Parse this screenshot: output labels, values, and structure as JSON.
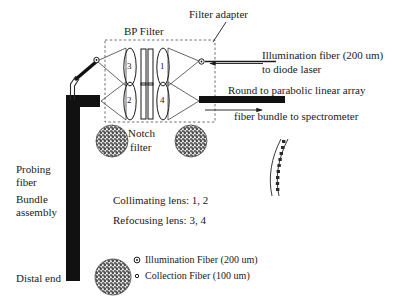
{
  "figure": {
    "kind": "fiber-optic probe schematic",
    "background": "#ffffff",
    "ink": "#1a1a1a"
  },
  "labels": {
    "filter_adapter": "Filter adapter",
    "bp_filter": "BP Filter",
    "notch_filter_line1": "Notch",
    "notch_filter_line2": "filter",
    "illumination_line1": "Illumination fiber (200 um)",
    "illumination_line2": "to diode laser",
    "spectrometer_line1": "Round to parabolic linear array",
    "spectrometer_line2": "fiber bundle to spectrometer",
    "probing_line1": "Probing",
    "probing_line2": "fiber",
    "bundle_line1": "Bundle",
    "bundle_line2": "assembly",
    "distal_end": "Distal end",
    "collimating_lens": "Collimating lens: 1, 2",
    "refocusing_lens": "Refocusing lens: 3, 4"
  },
  "lenses": {
    "top_left": "3",
    "top_right": "1",
    "bottom_left": "2",
    "bottom_right": "4"
  },
  "legend": {
    "items": [
      {
        "marker": "illumination-fiber-marker",
        "label": "Illumination Fiber (200 um)"
      },
      {
        "marker": "collection-fiber-marker",
        "label": "Collection Fiber (100 um)"
      }
    ]
  },
  "icons": {
    "illumination_port": "open-circle-port-icon",
    "adapter_port": "open-circle-port-icon",
    "fiber_bundle_cross_section": "speckled-circle-icon",
    "linear_array": "curved-linear-array-icon",
    "arrow_left": "arrow-left-icon",
    "arrow_right": "arrow-right-icon"
  }
}
